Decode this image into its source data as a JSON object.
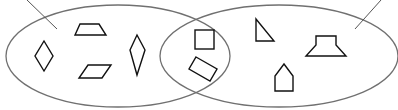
{
  "diagram": {
    "type": "venn",
    "colors": {
      "set_outline": "#707070",
      "shape_outline": "#111111",
      "background": "#ffffff"
    },
    "sets": [
      {
        "id": "left-set",
        "label": ""
      },
      {
        "id": "right-set",
        "label": ""
      }
    ],
    "regions": {
      "left_only": [
        "rhombus",
        "trapezoid",
        "parallelogram",
        "kite"
      ],
      "intersection": [
        "square",
        "rectangle"
      ],
      "right_only": [
        "right-triangle",
        "hexagon",
        "pentagon"
      ]
    }
  }
}
